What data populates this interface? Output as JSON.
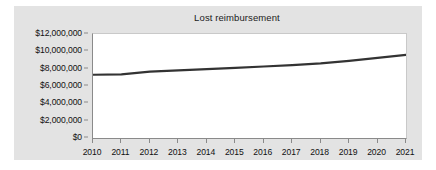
{
  "chart_data": {
    "type": "line",
    "title": "Lost reimbursement",
    "xlabel": "",
    "ylabel": "",
    "grid": false,
    "legend": false,
    "categories": [
      "2010",
      "2011",
      "2012",
      "2013",
      "2014",
      "2015",
      "2016",
      "2017",
      "2018",
      "2019",
      "2020",
      "2021"
    ],
    "x": [
      2010,
      2011,
      2012,
      2013,
      2014,
      2015,
      2016,
      2017,
      2018,
      2019,
      2020,
      2021
    ],
    "values": [
      7300000,
      7350000,
      7650000,
      7800000,
      7950000,
      8100000,
      8250000,
      8400000,
      8600000,
      8900000,
      9250000,
      9600000
    ],
    "series": [
      {
        "name": "Lost reimbursement",
        "color": "#333333",
        "values": [
          7300000,
          7350000,
          7650000,
          7800000,
          7950000,
          8100000,
          8250000,
          8400000,
          8600000,
          8900000,
          9250000,
          9600000
        ]
      }
    ],
    "ylim": [
      0,
      12000000
    ],
    "yticks": [
      0,
      2000000,
      4000000,
      6000000,
      8000000,
      10000000,
      12000000
    ],
    "ytick_labels": [
      "$0",
      "$2,000,000",
      "$4,000,000",
      "$6,000,000",
      "$8,000,000",
      "$10,000,000",
      "$12,000,000"
    ],
    "xtick_labels": [
      "2010",
      "2011",
      "2012",
      "2013",
      "2014",
      "2015",
      "2016",
      "2017",
      "2018",
      "2019",
      "2020",
      "2021"
    ],
    "colors": {
      "figure_background": "#e3e3e3",
      "plot_background": "#ffffff",
      "line": "#333333",
      "axis": "#8a8a8a",
      "text": "#111111"
    }
  }
}
